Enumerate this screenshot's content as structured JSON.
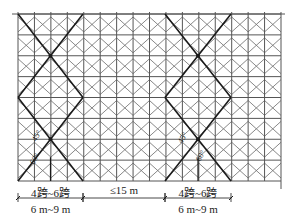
{
  "diagram": {
    "grid": {
      "left": 18,
      "right": 281,
      "top": 14,
      "bottom": 181,
      "columns": 16,
      "rows": 8
    },
    "braces": [
      {
        "name": "left-scissor-brace",
        "x1": 18,
        "x2": 83
      },
      {
        "name": "right-scissor-brace",
        "x1": 165,
        "x2": 231
      }
    ],
    "angles": [
      {
        "text": "45°",
        "x": 36,
        "y": 142
      },
      {
        "text": "60°",
        "x": 34,
        "y": 165
      },
      {
        "text": "45°",
        "x": 182,
        "y": 144
      },
      {
        "text": "60°",
        "x": 200,
        "y": 162
      }
    ],
    "dimensions": {
      "row1": [
        {
          "text": "4跨~6跨",
          "x1": 18,
          "x2": 83
        },
        {
          "text": "≤15 m",
          "x1": 83,
          "x2": 165
        },
        {
          "text": "4跨~6跨",
          "x1": 165,
          "x2": 231
        }
      ],
      "row2": [
        {
          "text": "6 m~9 m",
          "x1": 18,
          "x2": 83
        },
        {
          "text": "6 m~9 m",
          "x1": 165,
          "x2": 231
        }
      ]
    },
    "colors": {
      "grid": "#555555",
      "brace": "#1a1a1a",
      "text": "#222222"
    }
  }
}
